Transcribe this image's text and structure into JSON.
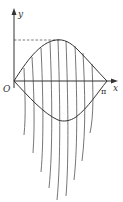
{
  "diagram": {
    "title": "",
    "labels": {
      "y_axis": "y",
      "x_axis": "x",
      "origin": "O",
      "x_end": "π"
    },
    "colors": {
      "stroke": "#333333",
      "strands": "#666666",
      "background": "#ffffff"
    },
    "geometry": {
      "origin": [
        14,
        81
      ],
      "pi_point": [
        107,
        81
      ],
      "peak": [
        60,
        40
      ],
      "trough": [
        62,
        121
      ],
      "y_axis_top": 10,
      "x_axis_right": 118
    },
    "strands": [
      {
        "x_top": 24,
        "bottom": [
          24,
          135
        ]
      },
      {
        "x_top": 32,
        "bottom": [
          33,
          153
        ]
      },
      {
        "x_top": 41,
        "bottom": [
          41,
          172
        ]
      },
      {
        "x_top": 50,
        "bottom": [
          49,
          188
        ]
      },
      {
        "x_top": 58,
        "bottom": [
          57,
          200
        ]
      },
      {
        "x_top": 66,
        "bottom": [
          66,
          196
        ]
      },
      {
        "x_top": 75,
        "bottom": [
          74,
          180
        ]
      },
      {
        "x_top": 83,
        "bottom": [
          82,
          161
        ]
      },
      {
        "x_top": 92,
        "bottom": [
          90,
          133
        ]
      }
    ]
  }
}
